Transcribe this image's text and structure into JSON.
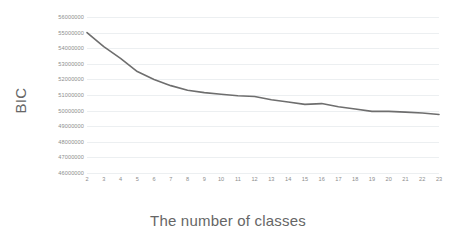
{
  "chart_data": {
    "type": "line",
    "title": "",
    "xlabel": "The number of classes",
    "ylabel": "BIC",
    "x": [
      2,
      3,
      4,
      5,
      6,
      7,
      8,
      9,
      10,
      11,
      12,
      13,
      14,
      15,
      16,
      17,
      18,
      19,
      20,
      21,
      22,
      23
    ],
    "values": [
      55000000,
      54100000,
      53350000,
      52500000,
      52000000,
      51600000,
      51300000,
      51150000,
      51050000,
      50950000,
      50900000,
      50700000,
      50550000,
      50400000,
      50450000,
      50250000,
      50100000,
      49950000,
      49950000,
      49900000,
      49850000,
      49750000
    ],
    "series": [
      {
        "name": "BIC",
        "values": [
          55000000,
          54100000,
          53350000,
          52500000,
          52000000,
          51600000,
          51300000,
          51150000,
          51050000,
          50950000,
          50900000,
          50700000,
          50550000,
          50400000,
          50450000,
          50250000,
          50100000,
          49950000,
          49950000,
          49900000,
          49850000,
          49750000
        ]
      }
    ],
    "categories": [
      "2",
      "3",
      "4",
      "5",
      "6",
      "7",
      "8",
      "9",
      "10",
      "11",
      "12",
      "13",
      "14",
      "15",
      "16",
      "17",
      "18",
      "19",
      "20",
      "21",
      "22",
      "23"
    ],
    "xlim": [
      2,
      23
    ],
    "ylim": [
      46000000,
      56000000
    ],
    "ytick_labels": [
      "56000000",
      "55000000",
      "54000000",
      "53000000",
      "52000000",
      "51000000",
      "50000000",
      "49000000",
      "48000000",
      "47000000",
      "46000000"
    ],
    "ytick_values": [
      56000000,
      55000000,
      54000000,
      53000000,
      52000000,
      51000000,
      50000000,
      49000000,
      48000000,
      47000000,
      46000000
    ],
    "xtick_labels": [
      "2",
      "3",
      "4",
      "5",
      "6",
      "7",
      "8",
      "9",
      "10",
      "11",
      "12",
      "13",
      "14",
      "15",
      "16",
      "17",
      "18",
      "19",
      "20",
      "21",
      "22",
      "23"
    ],
    "grid": true,
    "grid_axis": "y",
    "legend": false,
    "legend_position": "none",
    "line_color": "#6e6e6e",
    "grid_color": "#eceff1",
    "axis_label_color": "#8d8d8d",
    "title_color": "#666666",
    "background_color": "#ffffff",
    "markers": false,
    "line_width": 1.6
  }
}
